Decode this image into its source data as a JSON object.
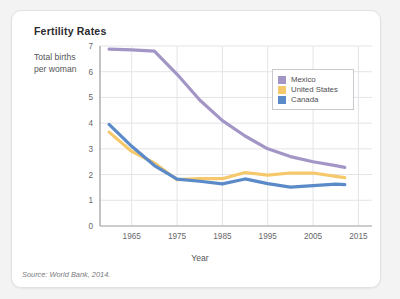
{
  "card": {
    "title": "Fertility Rates",
    "source": "Source: World Bank, 2014."
  },
  "legend": {
    "items": [
      {
        "label": "Mexico",
        "color": "#a396c6"
      },
      {
        "label": "United States",
        "color": "#f5c96b"
      },
      {
        "label": "Canada",
        "color": "#5b8ac9"
      }
    ]
  },
  "chart_data": {
    "type": "line",
    "title": "Fertility Rates",
    "xlabel": "Year",
    "ylabel": "Total births\nper woman",
    "xlim": [
      1958,
      2018
    ],
    "ylim": [
      0,
      7
    ],
    "xticks": [
      1965,
      1975,
      1985,
      1995,
      2005,
      2015
    ],
    "yticks": [
      0,
      1,
      2,
      3,
      4,
      5,
      6,
      7
    ],
    "grid": true,
    "legend_position": "upper-right-inside",
    "source": "Source: World Bank, 2014.",
    "x": [
      1960,
      1965,
      1970,
      1975,
      1980,
      1985,
      1990,
      1995,
      2000,
      2005,
      2010,
      2012
    ],
    "series": [
      {
        "name": "Mexico",
        "color": "#a396c6",
        "values": [
          6.88,
          6.85,
          6.8,
          5.9,
          4.9,
          4.1,
          3.5,
          3.0,
          2.7,
          2.5,
          2.35,
          2.28
        ]
      },
      {
        "name": "United States",
        "color": "#f5c96b",
        "values": [
          3.65,
          2.9,
          2.45,
          1.8,
          1.84,
          1.84,
          2.08,
          1.98,
          2.06,
          2.06,
          1.93,
          1.88
        ]
      },
      {
        "name": "Canada",
        "color": "#5b8ac9",
        "values": [
          3.95,
          3.1,
          2.35,
          1.82,
          1.74,
          1.64,
          1.83,
          1.65,
          1.51,
          1.57,
          1.63,
          1.61
        ]
      }
    ]
  }
}
